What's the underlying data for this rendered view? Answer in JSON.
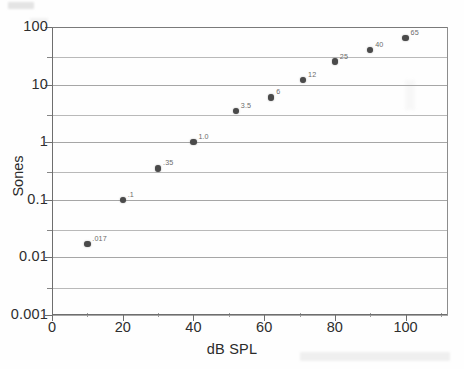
{
  "chart_data": {
    "type": "scatter",
    "title": "",
    "xlabel": "dB SPL",
    "ylabel": "Sones",
    "xlim": [
      0,
      112
    ],
    "ylim": [
      0.001,
      100
    ],
    "yscale": "log",
    "xscale": "linear",
    "grid": true,
    "legend": "none",
    "x_ticks": [
      "0",
      "20",
      "40",
      "60",
      "80",
      "100"
    ],
    "x_tick_values": [
      0,
      20,
      40,
      60,
      80,
      100
    ],
    "y_ticks": [
      "100",
      "10",
      "1",
      "0.1",
      "0.01",
      "0.001"
    ],
    "y_tick_values": [
      100,
      10,
      1,
      0.1,
      0.01,
      0.001
    ],
    "gridline_values": [
      100,
      30,
      10,
      3,
      1,
      0.3,
      0.1,
      0.03,
      0.01,
      0.003,
      0.001
    ],
    "x": [
      10,
      20,
      30,
      40,
      52,
      62,
      71,
      80,
      90,
      100
    ],
    "y": [
      0.017,
      0.1,
      0.35,
      1.0,
      3.5,
      6,
      12,
      25,
      40,
      65
    ],
    "point_labels": [
      ".017",
      ".1",
      ".35",
      "1.0",
      "3.5",
      "6",
      "12",
      "25",
      "40",
      "65"
    ],
    "marker_color": "#4a4a4a",
    "grid_color": "#a6a6a6",
    "axis_color": "#6e6e6e",
    "points": [
      {
        "x": 10,
        "y": 0.017,
        "label": ".017"
      },
      {
        "x": 20,
        "y": 0.1,
        "label": ".1"
      },
      {
        "x": 30,
        "y": 0.35,
        "label": ".35"
      },
      {
        "x": 40,
        "y": 1.0,
        "label": "1.0"
      },
      {
        "x": 52,
        "y": 3.5,
        "label": "3.5"
      },
      {
        "x": 62,
        "y": 6,
        "label": "6"
      },
      {
        "x": 71,
        "y": 12,
        "label": "12"
      },
      {
        "x": 80,
        "y": 25,
        "label": "25"
      },
      {
        "x": 90,
        "y": 40,
        "label": "40"
      },
      {
        "x": 100,
        "y": 65,
        "label": "65"
      }
    ]
  },
  "figure": {
    "x_axis_title": "dB SPL",
    "y_axis_title": "Sones"
  }
}
